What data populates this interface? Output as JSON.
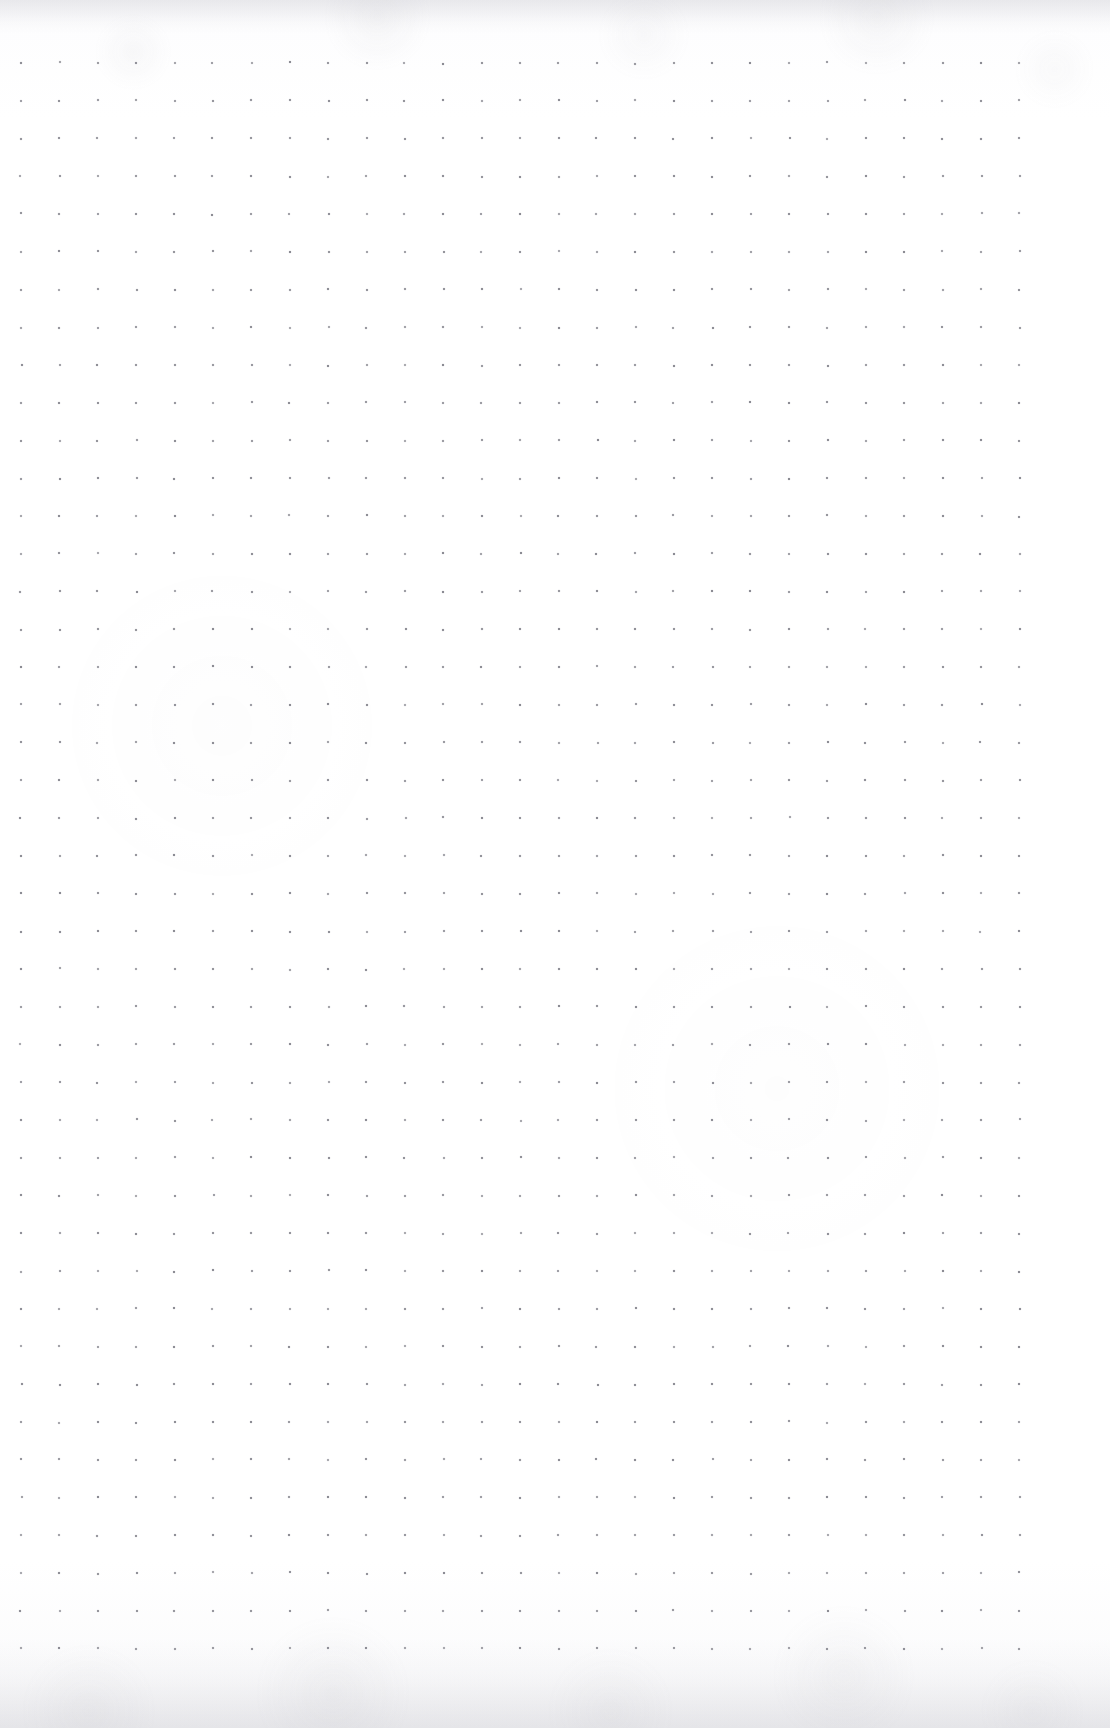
{
  "document": {
    "kind": "dot-grid-paper",
    "title": "Blank dot grid notebook page",
    "page_width": 1110,
    "page_height": 1728,
    "orientation": "portrait",
    "content_text": "",
    "annotations": []
  },
  "paper": {
    "background_color": "#fefeff",
    "base_tint_color": "#f7f7f9",
    "texture": "faint scan mottling",
    "edge_band_top_height": 34,
    "edge_band_bottom_height": 90,
    "edge_band_color": "#9b9ba6"
  },
  "grid": {
    "type": "dot",
    "dot_color": "#8b8b93",
    "dot_size_px": 2,
    "columns": 27,
    "rows": 43,
    "spacing_x_px": 38.4,
    "spacing_y_px": 37.75,
    "origin_x_px": 21,
    "origin_y_px": 63,
    "margin_left_px": 21,
    "margin_right_px": 91,
    "margin_top_px": 63,
    "margin_bottom_px": 79,
    "jitter_px": 0.6
  }
}
